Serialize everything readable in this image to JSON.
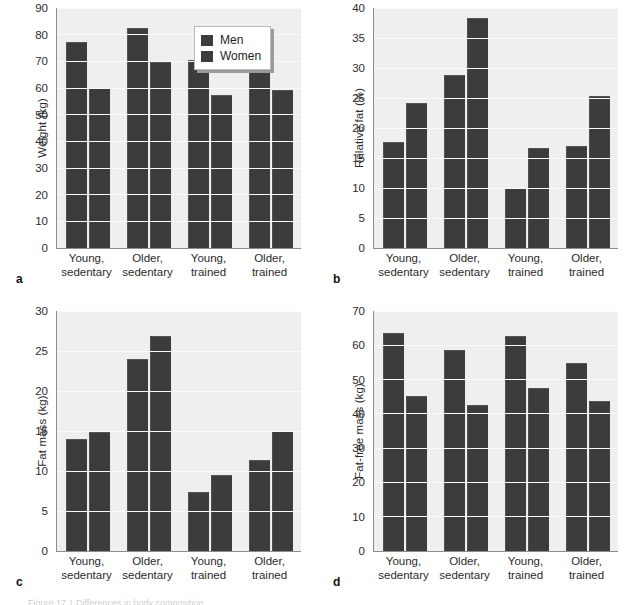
{
  "legend": {
    "title": "",
    "entries": [
      {
        "label": "Men",
        "color": "#3c3c3c"
      },
      {
        "label": "Women",
        "color": "#3c3c3c"
      }
    ]
  },
  "categories": [
    {
      "line1": "Young,",
      "line2": "sedentary"
    },
    {
      "line1": "Older,",
      "line2": "sedentary"
    },
    {
      "line1": "Young,",
      "line2": "trained"
    },
    {
      "line1": "Older,",
      "line2": "trained"
    }
  ],
  "panels": [
    {
      "letter": "a",
      "ylabel": "Weight (kg)"
    },
    {
      "letter": "b",
      "ylabel": "Relative fat (%)"
    },
    {
      "letter": "c",
      "ylabel": "Fat mass (kg)"
    },
    {
      "letter": "d",
      "ylabel": "Fat-free mass (kg)"
    }
  ],
  "caption": "Figure 17.1  Differences in body composition",
  "chart_data": [
    {
      "panel": "a",
      "type": "bar",
      "title": "",
      "xlabel": "",
      "ylabel": "Weight (kg)",
      "ylim": [
        0,
        90
      ],
      "ytick_step": 10,
      "yticks": [
        0,
        10,
        20,
        30,
        40,
        50,
        60,
        70,
        80,
        90
      ],
      "grid": true,
      "legend_position": "top-right",
      "categories": [
        "Young, sedentary",
        "Older, sedentary",
        "Young, trained",
        "Older, trained"
      ],
      "series": [
        {
          "name": "Men",
          "values": [
            77,
            82,
            70,
            66
          ]
        },
        {
          "name": "Women",
          "values": [
            59.7,
            69.2,
            57,
            58.8
          ]
        }
      ]
    },
    {
      "panel": "b",
      "type": "bar",
      "title": "",
      "xlabel": "",
      "ylabel": "Relative fat (%)",
      "ylim": [
        0,
        40
      ],
      "ytick_step": 5,
      "yticks": [
        0,
        5,
        10,
        15,
        20,
        25,
        30,
        35,
        40
      ],
      "grid": true,
      "legend_position": "none",
      "categories": [
        "Young, sedentary",
        "Older, sedentary",
        "Young, trained",
        "Older, trained"
      ],
      "series": [
        {
          "name": "Men",
          "values": [
            17.5,
            28.7,
            9.9,
            16.9
          ]
        },
        {
          "name": "Women",
          "values": [
            24.0,
            38.2,
            16.5,
            25.1
          ]
        }
      ]
    },
    {
      "panel": "c",
      "type": "bar",
      "title": "",
      "xlabel": "",
      "ylabel": "Fat mass (kg)",
      "ylim": [
        0,
        30
      ],
      "ytick_step": 5,
      "yticks": [
        0,
        5,
        10,
        15,
        20,
        25,
        30
      ],
      "grid": true,
      "legend_position": "none",
      "categories": [
        "Young, sedentary",
        "Older, sedentary",
        "Young, trained",
        "Older, trained"
      ],
      "series": [
        {
          "name": "Men",
          "values": [
            13.9,
            23.9,
            7.2,
            11.3
          ]
        },
        {
          "name": "Women",
          "values": [
            14.8,
            26.8,
            9.4,
            14.9
          ]
        }
      ]
    },
    {
      "panel": "d",
      "type": "bar",
      "title": "",
      "xlabel": "",
      "ylabel": "Fat-free mass (kg)",
      "ylim": [
        0,
        70
      ],
      "ytick_step": 10,
      "yticks": [
        0,
        10,
        20,
        30,
        40,
        50,
        60,
        70
      ],
      "grid": true,
      "legend_position": "none",
      "categories": [
        "Young, sedentary",
        "Older, sedentary",
        "Young, trained",
        "Older, trained"
      ],
      "series": [
        {
          "name": "Men",
          "values": [
            63.3,
            58.2,
            62.5,
            54.5
          ]
        },
        {
          "name": "Women",
          "values": [
            45.0,
            42.2,
            47.4,
            43.5
          ]
        }
      ]
    }
  ]
}
